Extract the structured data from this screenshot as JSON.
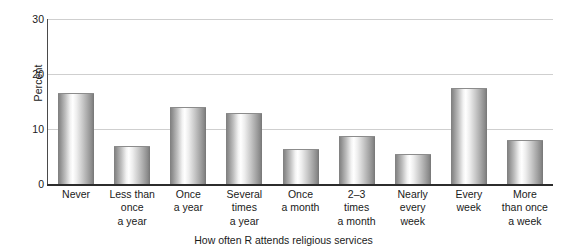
{
  "chart_data": {
    "type": "bar",
    "title": "",
    "xlabel": "How often R attends religious services",
    "ylabel": "Percent",
    "categories": [
      "Never",
      "Less than once a year",
      "Once a year",
      "Several times a year",
      "Once a month",
      "2–3 times a month",
      "Nearly every week",
      "Every week",
      "More than once a week"
    ],
    "category_lines": [
      [
        "Never"
      ],
      [
        "Less than",
        "once",
        "a year"
      ],
      [
        "Once",
        "a year"
      ],
      [
        "Several",
        "times",
        "a year"
      ],
      [
        "Once",
        "a month"
      ],
      [
        "2–3",
        "times",
        "a month"
      ],
      [
        "Nearly",
        "every",
        "week"
      ],
      [
        "Every",
        "week"
      ],
      [
        "More",
        "than once",
        "a week"
      ]
    ],
    "values": [
      16.6,
      7.0,
      14.0,
      13.0,
      6.4,
      8.8,
      5.4,
      17.4,
      8.0
    ],
    "ylim": [
      0,
      30
    ],
    "yticks": [
      0,
      10,
      20,
      30
    ],
    "ytick_labels": [
      "0",
      "10",
      "20",
      "30"
    ],
    "grid": true,
    "grid_axis": "y",
    "legend": "none",
    "bar_style": "cylindrical-gradient-gray"
  },
  "colors": {
    "background": "#ffffff",
    "gridline": "#cfcfcf",
    "axis": "#2c2c2c",
    "text": "#1a1a1a",
    "bar_light": "#ffffff",
    "bar_dark": "#767676"
  }
}
